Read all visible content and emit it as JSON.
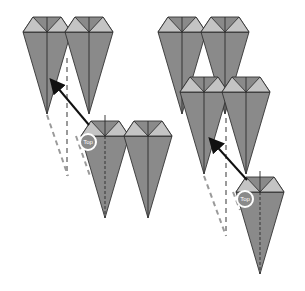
{
  "diagram": {
    "colors": {
      "cone_body": "#8a8a8a",
      "cone_top_light": "#c4c4c4",
      "outline": "#333333",
      "guide_dash": "#9a9a9a",
      "arrow": "#111111",
      "background": "#ffffff"
    },
    "badges": [
      {
        "label": "Top",
        "position": "left-step"
      },
      {
        "label": "Top",
        "position": "right-step"
      }
    ]
  }
}
